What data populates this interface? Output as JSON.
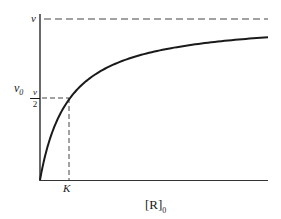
{
  "chart_data": {
    "type": "line",
    "title": "",
    "xlabel": "[R]0",
    "ylabel": "v0",
    "x_tick_labels": [
      "K"
    ],
    "y_tick_labels": [
      "v",
      "v/2"
    ],
    "series": [
      {
        "name": "v0 = v[R]0 / (K + [R]0)",
        "description": "Hyperbolic saturation curve rising from origin toward asymptote v",
        "x": [
          0,
          0.5,
          1,
          2,
          3,
          4,
          6,
          8,
          10,
          15
        ],
        "values": [
          0,
          0.333,
          0.5,
          0.667,
          0.75,
          0.8,
          0.857,
          0.889,
          0.909,
          0.9375
        ]
      }
    ],
    "reference_lines": [
      {
        "type": "horizontal",
        "label": "v",
        "value": 1.0,
        "style": "dashed"
      },
      {
        "type": "horizontal",
        "label": "v/2",
        "value": 0.5,
        "style": "dashed",
        "x_to": 1
      },
      {
        "type": "vertical",
        "label": "K",
        "value": 1,
        "style": "dashed",
        "y_to": 0.5
      }
    ],
    "xlim": [
      0,
      15.5
    ],
    "ylim": [
      0,
      1.05
    ],
    "grid": false,
    "legend": "none"
  },
  "labels": {
    "v_top": "v",
    "y_axis_main": "v",
    "y_axis_sub": "0",
    "half_num": "v",
    "half_den": "2",
    "k_tick": "K",
    "x_axis_main": "[R]",
    "x_axis_sub": "0"
  },
  "colors": {
    "ink": "#1a1a1a",
    "dash": "#444444",
    "background": "#ffffff"
  }
}
